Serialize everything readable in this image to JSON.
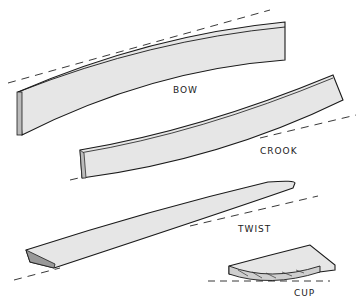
{
  "diagram": {
    "labels": {
      "bow": "BOW",
      "crook": "CROOK",
      "twist": "TWIST",
      "cup": "CUP"
    },
    "colors": {
      "board_fill": "#e6e6e6",
      "stroke": "#1a1a1a",
      "background": "#ffffff"
    }
  }
}
